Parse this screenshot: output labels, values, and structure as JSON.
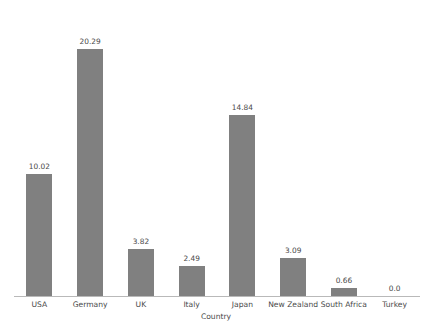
{
  "chart_data": {
    "type": "bar",
    "title": "",
    "subtitle": "",
    "xlabel": "Country",
    "ylabel": "",
    "categories": [
      "USA",
      "Germany",
      "UK",
      "Italy",
      "Japan",
      "New Zealand",
      "South Africa",
      "Turkey"
    ],
    "values": [
      10.02,
      20.29,
      3.82,
      2.49,
      14.84,
      3.09,
      0.66,
      0.0
    ],
    "value_labels": [
      "10.02",
      "20.29",
      "3.82",
      "2.49",
      "14.84",
      "3.09",
      "0.66",
      "0.0"
    ],
    "ylim": [
      0,
      22.5
    ],
    "xlim": [
      0,
      8
    ],
    "grid": false,
    "legend": null,
    "legend_position": "none",
    "y_axis_visible": false,
    "y_tick_labels": [],
    "bar_color": "#808080",
    "axis_color": "#b9b9b9",
    "text_color": "#4a4a4a",
    "background_color": "#ffffff",
    "data_labels_shown": true,
    "series": [
      {
        "name": "",
        "values": [
          10.02,
          20.29,
          3.82,
          2.49,
          14.84,
          3.09,
          0.66,
          0.0
        ]
      }
    ]
  },
  "axis": {
    "x_title": "Country"
  }
}
